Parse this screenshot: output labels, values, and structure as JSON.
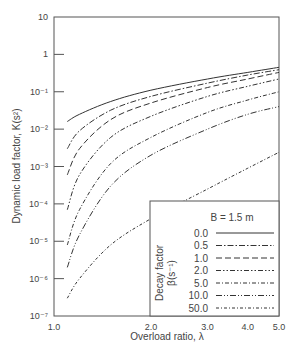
{
  "chart_data": {
    "type": "line",
    "title": "",
    "xlabel": "Overload ratio, λ",
    "ylabel": "Dynamic load factor, K(s²)",
    "xscale": "log",
    "yscale": "log",
    "xlim": [
      1.0,
      5.0
    ],
    "ylim": [
      1e-07,
      10
    ],
    "x_ticks": [
      "1.0",
      "2.0",
      "3.0",
      "4.0",
      "5.0"
    ],
    "y_ticks": [
      "10",
      "1",
      "10⁻¹",
      "10⁻²",
      "10⁻³",
      "10⁻⁴",
      "10⁻⁵",
      "10⁻⁶",
      "10⁻⁷"
    ],
    "legend": {
      "title": "B = 1.5 m",
      "side_label": "Decay factor",
      "side_unit": "β(s⁻¹)",
      "position": "lower right",
      "entries": [
        "0.0",
        "0.5",
        "1.0",
        "2.0",
        "5.0",
        "10.0",
        "50.0"
      ]
    },
    "x": [
      1.1,
      1.2,
      1.5,
      2.0,
      3.0,
      4.0,
      5.0
    ],
    "series": [
      {
        "name": "0.0",
        "dash": "",
        "values": [
          0.016,
          0.025,
          0.055,
          0.11,
          0.22,
          0.33,
          0.45
        ]
      },
      {
        "name": "0.5",
        "dash": "6,2,1.5,2",
        "values": [
          0.003,
          0.009,
          0.032,
          0.075,
          0.17,
          0.28,
          0.39
        ]
      },
      {
        "name": "1.0",
        "dash": "6,3",
        "values": [
          0.0006,
          0.003,
          0.018,
          0.05,
          0.13,
          0.22,
          0.33
        ]
      },
      {
        "name": "2.0",
        "dash": "5,2,1.5,2,1.5,2",
        "values": [
          7e-05,
          0.0006,
          0.006,
          0.022,
          0.075,
          0.14,
          0.22
        ]
      },
      {
        "name": "5.0",
        "dash": "4,2,1,2",
        "values": [
          8e-06,
          7e-05,
          0.0012,
          0.006,
          0.028,
          0.06,
          0.1
        ]
      },
      {
        "name": "10.0",
        "dash": "6,2,1,2,1,2",
        "values": [
          2e-06,
          1.5e-05,
          0.0003,
          0.002,
          0.01,
          0.025,
          0.04
        ]
      },
      {
        "name": "50.0",
        "dash": "3,2,1,2",
        "values": [
          3e-07,
          1e-06,
          8e-06,
          4e-05,
          0.00025,
          0.0009,
          0.0024
        ]
      }
    ]
  }
}
